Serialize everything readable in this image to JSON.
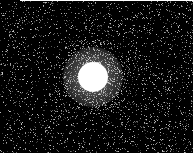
{
  "image": {
    "description": "Noisy astronomical-style grayscale image of a single bright point source on a dark background",
    "width": 195,
    "height": 160,
    "background_color": "#000000",
    "frame_color": "#ffffff",
    "field": {
      "x": 0,
      "y": 1,
      "width": 193,
      "height": 152
    },
    "source": {
      "center_x": 93,
      "center_y": 77,
      "core_radius": 15,
      "halo_radius": 30,
      "core_color": "#ffffff"
    },
    "noise": {
      "density": 0.09,
      "seed": 7,
      "min_gray": 40,
      "max_gray": 200
    }
  }
}
